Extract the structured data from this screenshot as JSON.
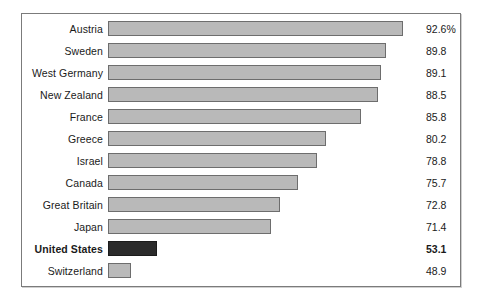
{
  "chart_data": {
    "type": "bar",
    "orientation": "horizontal",
    "title": "",
    "subtitle": "",
    "xlabel": "",
    "ylabel": "",
    "grid": false,
    "legend": false,
    "value_unit": "%",
    "axis_baseline": 45.2,
    "axis_max": 95.0,
    "categories": [
      "Austria",
      "Sweden",
      "West Germany",
      "New Zealand",
      "France",
      "Greece",
      "Israel",
      "Canada",
      "Great Britain",
      "Japan",
      "United States",
      "Switzerland"
    ],
    "values": [
      92.6,
      89.8,
      89.1,
      88.5,
      85.8,
      80.2,
      78.8,
      75.7,
      72.8,
      71.4,
      53.1,
      48.9
    ],
    "value_labels": [
      "92.6%",
      "89.8",
      "89.1",
      "88.5",
      "85.8",
      "80.2",
      "78.8",
      "75.7",
      "72.8",
      "71.4",
      "53.1",
      "48.9"
    ],
    "highlight_category": "United States",
    "colors": {
      "bar_fill": "#b9b9b9",
      "bar_border": "#6d6d6d",
      "highlight_fill": "#2b2b2b",
      "highlight_border": "#1b1b1b",
      "frame_border": "#7b7b7b",
      "background": "#ffffff",
      "text": "#1a1a1a"
    }
  },
  "rows": [
    {
      "label": "Austria",
      "value_label": "92.6%",
      "value": 92.6,
      "highlight": false
    },
    {
      "label": "Sweden",
      "value_label": "89.8",
      "value": 89.8,
      "highlight": false
    },
    {
      "label": "West Germany",
      "value_label": "89.1",
      "value": 89.1,
      "highlight": false
    },
    {
      "label": "New Zealand",
      "value_label": "88.5",
      "value": 88.5,
      "highlight": false
    },
    {
      "label": "France",
      "value_label": "85.8",
      "value": 85.8,
      "highlight": false
    },
    {
      "label": "Greece",
      "value_label": "80.2",
      "value": 80.2,
      "highlight": false
    },
    {
      "label": "Israel",
      "value_label": "78.8",
      "value": 78.8,
      "highlight": false
    },
    {
      "label": "Canada",
      "value_label": "75.7",
      "value": 75.7,
      "highlight": false
    },
    {
      "label": "Great Britain",
      "value_label": "72.8",
      "value": 72.8,
      "highlight": false
    },
    {
      "label": "Japan",
      "value_label": "71.4",
      "value": 71.4,
      "highlight": false
    },
    {
      "label": "United States",
      "value_label": "53.1",
      "value": 53.1,
      "highlight": true
    },
    {
      "label": "Switzerland",
      "value_label": "48.9",
      "value": 48.9,
      "highlight": false
    }
  ]
}
